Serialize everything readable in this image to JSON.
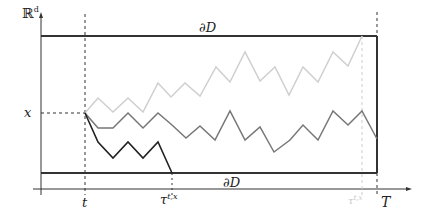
{
  "diagram": {
    "y_axis_label": "ℝ",
    "y_axis_label_sup": "d",
    "x_level_label": "x",
    "top_boundary_label": "∂D",
    "bottom_boundary_label": "∂D",
    "tick_t_label": "t",
    "tick_tau_label": "τ",
    "tick_tau_sup": "t,x",
    "tick_T_label": "T",
    "tick_tau_light_label": "τ",
    "tick_tau_light_sup": "t,x",
    "colors": {
      "axis": "#333333",
      "boundary": "#333333",
      "path_light": "#cfcfcf",
      "path_mid": "#777777",
      "path_dark": "#222222",
      "tau_light_label": "#c8c8c8"
    },
    "paths": {
      "light": [
        [
          85,
          113
        ],
        [
          98,
          98
        ],
        [
          113,
          112
        ],
        [
          128,
          98
        ],
        [
          143,
          112
        ],
        [
          158,
          83
        ],
        [
          171,
          97
        ],
        [
          185,
          83
        ],
        [
          200,
          96
        ],
        [
          216,
          67
        ],
        [
          230,
          82
        ],
        [
          245,
          52
        ],
        [
          260,
          81
        ],
        [
          275,
          67
        ],
        [
          289,
          95
        ],
        [
          303,
          67
        ],
        [
          318,
          82
        ],
        [
          333,
          52
        ],
        [
          348,
          66
        ],
        [
          362,
          36
        ]
      ],
      "mid": [
        [
          85,
          113
        ],
        [
          98,
          128
        ],
        [
          113,
          128
        ],
        [
          128,
          113
        ],
        [
          143,
          128
        ],
        [
          158,
          113
        ],
        [
          172,
          125
        ],
        [
          186,
          138
        ],
        [
          200,
          126
        ],
        [
          215,
          140
        ],
        [
          230,
          111
        ],
        [
          245,
          140
        ],
        [
          260,
          127
        ],
        [
          274,
          152
        ],
        [
          290,
          140
        ],
        [
          303,
          125
        ],
        [
          318,
          140
        ],
        [
          333,
          111
        ],
        [
          348,
          125
        ],
        [
          362,
          111
        ],
        [
          377,
          139
        ]
      ],
      "dark": [
        [
          85,
          113
        ],
        [
          98,
          142
        ],
        [
          113,
          158
        ],
        [
          128,
          142
        ],
        [
          143,
          158
        ],
        [
          158,
          142
        ],
        [
          172,
          173
        ]
      ]
    }
  }
}
